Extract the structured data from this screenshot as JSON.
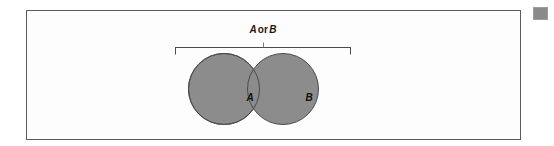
{
  "figure": {
    "type": "venn-diagram",
    "caption": {
      "full_text": "A or B",
      "left_operand": "A",
      "operator": "or",
      "right_operand": "B"
    },
    "sets": [
      {
        "id": "A",
        "label": "A"
      },
      {
        "id": "B",
        "label": "B"
      }
    ],
    "colors": {
      "set_fill": "#8c8c8c",
      "set_outline": "#4a4a4a",
      "panel_background": "#fdfdfd",
      "panel_border": "#5a5a5a",
      "label_text": "#1a1a1a",
      "bracket_line": "#4a4a4a",
      "corner_swatch": "#8a8a8a"
    },
    "geometry": {
      "circle_a_cx": 197,
      "circle_b_cx": 256,
      "circle_cy": 78,
      "circle_r": 35.5,
      "bracket_left_x": 148,
      "bracket_right_x": 324,
      "bracket_y": 36,
      "bracket_tick_height": 7,
      "bracket_center_tick_height": 5
    }
  },
  "corner_swatch": {
    "name": "corner-swatch"
  }
}
